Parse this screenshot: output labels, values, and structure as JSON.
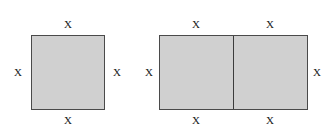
{
  "diagram": {
    "background_color": "#ffffff",
    "fill_color": "#d0d0d0",
    "stroke_color": "#4a4a4a",
    "label_color": "#1a1a1a",
    "figures": [
      {
        "id": "square-one",
        "shape": "square",
        "labels": {
          "top": "X",
          "left": "X",
          "right": "X",
          "bottom": "X"
        }
      },
      {
        "id": "rect-two",
        "shape": "rectangle-split-in-two",
        "labels": {
          "top_left": "X",
          "top_right": "X",
          "left": "X",
          "right": "X",
          "bottom_left": "X",
          "bottom_right": "X"
        }
      }
    ]
  }
}
